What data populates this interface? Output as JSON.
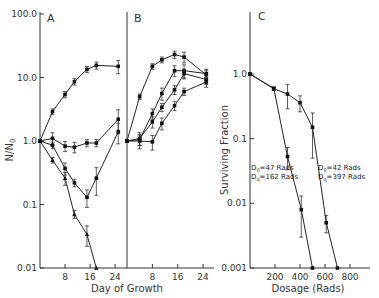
{
  "chart_data": [
    {
      "panel": "A",
      "type": "line",
      "title": "A",
      "xlabel": "Day of Growth",
      "ylabel": "N/N0",
      "yscale": "log",
      "ylim": [
        0.01,
        100
      ],
      "xlim": [
        0,
        27
      ],
      "x_ticks": [
        8,
        16,
        24
      ],
      "x_tick_labels": [
        "8",
        "16",
        "24"
      ],
      "y_ticks": [
        0.01,
        0.1,
        1,
        10,
        100
      ],
      "y_tick_labels": [
        "0.01",
        "0.1",
        "1.0",
        "10.0",
        "100.0"
      ],
      "series": [
        {
          "name": "A-1",
          "marker": "square",
          "x": [
            0,
            4,
            8,
            11,
            15,
            18,
            25
          ],
          "y": [
            1.0,
            2.9,
            5.4,
            8.6,
            13.4,
            15.5,
            15.0
          ],
          "err": [
            0,
            0.3,
            0.6,
            1.0,
            1.5,
            2.0,
            3.5
          ]
        },
        {
          "name": "A-2",
          "marker": "square",
          "x": [
            0,
            4,
            8,
            11,
            15,
            18,
            25
          ],
          "y": [
            1.0,
            1.1,
            0.83,
            0.8,
            0.93,
            0.93,
            2.2
          ],
          "err": [
            0,
            0.25,
            0.15,
            0.15,
            0.12,
            0.12,
            0.9
          ]
        },
        {
          "name": "A-3",
          "marker": "square",
          "x": [
            0,
            4,
            8,
            11,
            15,
            18,
            25
          ],
          "y": [
            1.0,
            0.86,
            0.37,
            0.22,
            0.13,
            0.26,
            1.4
          ],
          "err": [
            0,
            0.1,
            0.08,
            0.03,
            0.04,
            0.12,
            0.5
          ]
        },
        {
          "name": "A-4",
          "marker": "triangle",
          "x": [
            0,
            4,
            8,
            11,
            15,
            18
          ],
          "y": [
            1.0,
            0.5,
            0.26,
            0.07,
            0.034,
            0.01
          ],
          "err": [
            0,
            0.05,
            0.06,
            0.01,
            0.012,
            0
          ]
        }
      ]
    },
    {
      "panel": "B",
      "type": "line",
      "title": "B",
      "xlabel": "Day of Growth",
      "yscale": "log",
      "ylim": [
        0.01,
        100
      ],
      "xlim": [
        0,
        27
      ],
      "x_ticks": [
        8,
        16,
        24
      ],
      "x_tick_labels": [
        "8",
        "16",
        "24"
      ],
      "series": [
        {
          "name": "B-1",
          "marker": "square",
          "x": [
            0,
            4,
            8,
            11,
            15,
            18,
            25
          ],
          "y": [
            1.0,
            5.0,
            15,
            19,
            23,
            21,
            11
          ],
          "err": [
            0,
            0.5,
            1.5,
            2.0,
            3.0,
            4.0,
            2.0
          ]
        },
        {
          "name": "B-2",
          "marker": "square",
          "x": [
            0,
            4,
            8,
            11,
            15,
            18,
            25
          ],
          "y": [
            1.0,
            1.05,
            2.7,
            5.6,
            12.8,
            12.8,
            11.5
          ],
          "err": [
            0,
            0.2,
            0.5,
            1.2,
            2.5,
            3.0,
            2.0
          ]
        },
        {
          "name": "B-3",
          "marker": "square",
          "x": [
            0,
            4,
            8,
            11,
            15,
            18,
            25
          ],
          "y": [
            1.0,
            1.1,
            2.0,
            3.4,
            6.4,
            11.5,
            9.3
          ],
          "err": [
            0,
            0.25,
            0.4,
            0.5,
            1.0,
            2.0,
            1.5
          ]
        },
        {
          "name": "B-4",
          "marker": "square",
          "x": [
            0,
            4,
            8,
            11,
            15,
            18,
            25
          ],
          "y": [
            1.0,
            1.0,
            0.97,
            1.9,
            3.6,
            6.0,
            8.5
          ],
          "err": [
            0,
            0.25,
            0.25,
            0.4,
            0.6,
            0.8,
            1.5
          ]
        }
      ]
    },
    {
      "panel": "C",
      "type": "line",
      "title": "C",
      "xlabel": "Dosage (Rads)",
      "ylabel": "Surviving Fraction",
      "yscale": "log",
      "ylim": [
        0.001,
        1.0
      ],
      "xlim": [
        0,
        950
      ],
      "x_ticks": [
        200,
        400,
        600,
        800
      ],
      "x_tick_labels": [
        "200",
        "400",
        "600",
        "800"
      ],
      "y_ticks": [
        0.001,
        0.01,
        0.1,
        1.0
      ],
      "y_tick_labels": [
        "0.001",
        "0.01",
        "0.1",
        "1.0"
      ],
      "series": [
        {
          "name": "D0=47 Rads, Dq=162 Rads",
          "marker": "square",
          "x": [
            0,
            190,
            300,
            410,
            500
          ],
          "y": [
            1.0,
            0.6,
            0.053,
            0.008,
            0.001
          ],
          "err": [
            0,
            0.03,
            0.02,
            0.005,
            0
          ]
        },
        {
          "name": "D0=42 Rads, Dq=397 Rads",
          "marker": "square",
          "x": [
            0,
            190,
            300,
            400,
            500,
            610,
            700
          ],
          "y": [
            1.0,
            0.59,
            0.49,
            0.36,
            0.15,
            0.005,
            0.001
          ],
          "err": [
            0,
            0.03,
            0.2,
            0.1,
            0.1,
            0.0015,
            0
          ]
        }
      ],
      "annotations": [
        {
          "line1": "D",
          "sub1": "0",
          "val1": "=47 Rads",
          "line2": "D",
          "sub2": "q",
          "val2": "=162 Rads"
        },
        {
          "line1": "D",
          "sub1": "0",
          "val1": "=42 Rads",
          "line2": "D",
          "sub2": "q",
          "val2": "=397 Rads"
        }
      ]
    }
  ]
}
